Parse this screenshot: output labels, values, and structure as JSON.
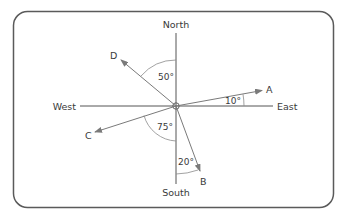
{
  "diagram": {
    "type": "compass-bearings",
    "compass": {
      "north": "North",
      "south": "South",
      "east": "East",
      "west": "West"
    },
    "points": [
      {
        "label": "A",
        "reference": "East",
        "angle_label": "10°",
        "direction": "10° north of East"
      },
      {
        "label": "B",
        "reference": "South",
        "angle_label": "20°",
        "direction": "20° east of South"
      },
      {
        "label": "C",
        "reference": "South",
        "angle_label": "75°",
        "direction": "75° west of South"
      },
      {
        "label": "D",
        "reference": "North",
        "angle_label": "50°",
        "direction": "50° west of North"
      }
    ],
    "colors": {
      "frame": "#5a5a5a",
      "axis": "#555555",
      "arrow": "#7a7a7a",
      "text": "#3a3a3a"
    }
  }
}
